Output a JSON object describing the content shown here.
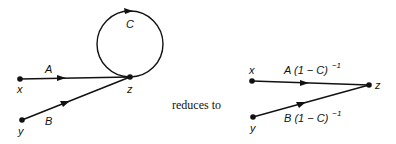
{
  "left_graph": {
    "nodes": [
      {
        "id": "x",
        "label": "x"
      },
      {
        "id": "y",
        "label": "y"
      },
      {
        "id": "z",
        "label": "z"
      }
    ],
    "edges": [
      {
        "from": "x",
        "to": "z",
        "label": "A"
      },
      {
        "from": "y",
        "to": "z",
        "label": "B"
      },
      {
        "from": "z",
        "to": "z",
        "label": "C",
        "type": "self-loop"
      }
    ]
  },
  "connector_text": "reduces to",
  "right_graph": {
    "nodes": [
      {
        "id": "x",
        "label": "x"
      },
      {
        "id": "y",
        "label": "y"
      },
      {
        "id": "z",
        "label": "z"
      }
    ],
    "edges": [
      {
        "from": "x",
        "to": "z",
        "label_main": "A (1 − C)",
        "label_sup": "−1"
      },
      {
        "from": "y",
        "to": "z",
        "label_main": "B (1 − C)",
        "label_sup": "−1"
      }
    ]
  }
}
